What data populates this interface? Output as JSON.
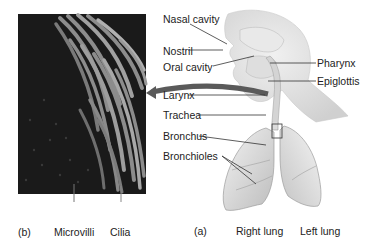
{
  "figure": {
    "panel_b": {
      "tag": "(b)",
      "labels": {
        "microvilli": "Microvilli",
        "cilia": "Cilia"
      }
    },
    "panel_a": {
      "tag": "(a)",
      "labels": {
        "nasal_cavity": "Nasal cavity",
        "nostril": "Nostril",
        "oral_cavity": "Oral cavity",
        "pharynx": "Pharynx",
        "epiglottis": "Epiglottis",
        "larynx": "Larynx",
        "trachea": "Trachea",
        "bronchus": "Bronchus",
        "bronchioles": "Bronchioles",
        "right_lung": "Right lung",
        "left_lung": "Left lung"
      }
    },
    "colors": {
      "micrograph_bg": "#1c1c1c",
      "cilia": "#9a9a9a",
      "anatomy": "#e2e2e2",
      "arrow": "#5a5a5a",
      "leader": "#333333"
    }
  }
}
